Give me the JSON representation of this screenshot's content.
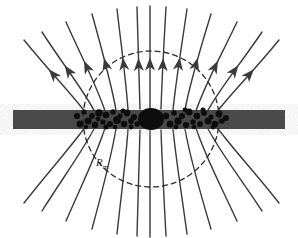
{
  "figure": {
    "type": "physics-diagram",
    "width": 298,
    "height": 238,
    "background": "#ffffff"
  },
  "colors": {
    "field_line": "#3a3a3a",
    "disk_bar": "#4a4a4a",
    "disk_bar_edge": "#5a5a5a",
    "central_object": "#111111",
    "clump": "#111111",
    "dashed_circle": "#2b2b2b",
    "label_text": "#2a2a2a"
  },
  "labels": [
    {
      "name": "magnetospheric-radius-label",
      "base": "R",
      "subscript": "m",
      "text": "Rm",
      "x": 96,
      "y": 156
    }
  ],
  "disk": {
    "name": "accretion-disk-bar",
    "x": 13,
    "y": 110,
    "width": 272,
    "height": 19,
    "fill": "#4a4a4a",
    "description": "horizontal dark-gray accretion disk seen edge-on"
  },
  "central_object": {
    "name": "central-star",
    "cx": 151,
    "cy": 119,
    "rx": 13,
    "ry": 11,
    "fill": "#111111",
    "description": "dark central magnetized star"
  },
  "dashed_circle": {
    "name": "magnetospheric-radius-circle",
    "cx": 151,
    "cy": 119,
    "r": 68,
    "stroke": "#2b2b2b",
    "dash": "5 4",
    "description": "dashed circle marking the magnetospheric radius Rm"
  },
  "clumps": {
    "name": "disk-material-clumps",
    "count": 46,
    "radius_range": [
      2.0,
      4.2
    ],
    "fill": "#111111",
    "description": "clumps of disk material crowded near the inner disk edge along the midplane",
    "points": [
      [
        77,
        116,
        3.1
      ],
      [
        80,
        124,
        3.4
      ],
      [
        84,
        112,
        2.6
      ],
      [
        88,
        121,
        3.6
      ],
      [
        92,
        116,
        2.9
      ],
      [
        95,
        125,
        3.2
      ],
      [
        99,
        113,
        3.8
      ],
      [
        103,
        122,
        2.7
      ],
      [
        106,
        115,
        3.3
      ],
      [
        110,
        124,
        3.0
      ],
      [
        113,
        112,
        2.8
      ],
      [
        117,
        120,
        3.9
      ],
      [
        120,
        116,
        2.6
      ],
      [
        124,
        124,
        3.2
      ],
      [
        127,
        113,
        3.4
      ],
      [
        131,
        121,
        2.9
      ],
      [
        134,
        117,
        3.1
      ],
      [
        137,
        124,
        2.7
      ],
      [
        98,
        119,
        2.4
      ],
      [
        106,
        127,
        2.5
      ],
      [
        115,
        127,
        2.3
      ],
      [
        123,
        111,
        2.5
      ],
      [
        131,
        127,
        2.4
      ],
      [
        86,
        127,
        2.3
      ],
      [
        166,
        116,
        3.2
      ],
      [
        170,
        124,
        3.5
      ],
      [
        174,
        113,
        2.8
      ],
      [
        178,
        121,
        3.7
      ],
      [
        182,
        116,
        3.0
      ],
      [
        186,
        125,
        3.1
      ],
      [
        189,
        112,
        3.6
      ],
      [
        193,
        122,
        2.7
      ],
      [
        197,
        116,
        3.3
      ],
      [
        200,
        124,
        2.9
      ],
      [
        204,
        113,
        3.0
      ],
      [
        208,
        121,
        3.5
      ],
      [
        211,
        117,
        2.6
      ],
      [
        215,
        124,
        3.2
      ],
      [
        219,
        114,
        3.4
      ],
      [
        222,
        121,
        2.8
      ],
      [
        226,
        118,
        3.0
      ],
      [
        176,
        127,
        2.4
      ],
      [
        185,
        110,
        2.4
      ],
      [
        194,
        127,
        2.3
      ],
      [
        203,
        110,
        2.5
      ],
      [
        213,
        127,
        2.4
      ]
    ]
  },
  "field_lines": {
    "name": "magnetic-field-lines",
    "count": 20,
    "stroke": "#3a3a3a",
    "stroke_width": 1.4,
    "description": "dipolar magnetic field lines threading the disk; arrowheads on the upper halves point outward away from the star",
    "arrowheads": {
      "present_on": "upper-half",
      "direction": "outward",
      "style": "slim-barbed",
      "count": 10
    },
    "upper": [
      {
        "d": "M 86,113 C 70,92 50,72 24,40",
        "arrow_t": 0.6
      },
      {
        "d": "M 95,112 C 82,88 64,66 42,32",
        "arrow_t": 0.58
      },
      {
        "d": "M 105,111 C 96,84 82,58 66,22",
        "arrow_t": 0.56
      },
      {
        "d": "M 116,110 C 111,82 102,50 92,14",
        "arrow_t": 0.54
      },
      {
        "d": "M 128,110 C 126,80 121,44 117,9",
        "arrow_t": 0.52
      },
      {
        "d": "M 140,109 C 139,78 138,42 137,7",
        "arrow_t": 0.5
      },
      {
        "d": "M 150,109 C 150,78 150,42 150,6",
        "arrow_t": 0.5
      },
      {
        "d": "M 161,109 C 162,78 164,42 166,7",
        "arrow_t": 0.5
      },
      {
        "d": "M 173,110 C 176,80 182,44 187,9",
        "arrow_t": 0.52
      },
      {
        "d": "M 185,110 C 190,82 200,50 211,14",
        "arrow_t": 0.54
      },
      {
        "d": "M 196,111 C 205,84 220,58 237,22",
        "arrow_t": 0.56
      },
      {
        "d": "M 207,112 C 220,88 239,66 262,32",
        "arrow_t": 0.58
      },
      {
        "d": "M 216,113 C 232,92 253,72 279,40",
        "arrow_t": 0.6
      }
    ],
    "lower": [
      {
        "d": "M 86,126 C 70,148 50,170 24,203"
      },
      {
        "d": "M 95,127 C 82,152 64,176 42,211"
      },
      {
        "d": "M 105,128 C 96,156 82,184 66,221"
      },
      {
        "d": "M 116,129 C 111,158 102,192 92,229"
      },
      {
        "d": "M 128,129 C 126,160 121,196 117,234"
      },
      {
        "d": "M 140,130 C 139,162 138,198 137,236"
      },
      {
        "d": "M 150,130 C 150,162 150,198 150,237"
      },
      {
        "d": "M 161,130 C 162,162 164,198 166,236"
      },
      {
        "d": "M 173,129 C 176,160 182,196 187,234"
      },
      {
        "d": "M 185,129 C 190,158 200,192 211,229"
      },
      {
        "d": "M 196,128 C 205,156 220,184 237,221"
      },
      {
        "d": "M 207,127 C 220,152 239,176 262,211"
      },
      {
        "d": "M 216,126 C 232,148 253,170 279,203"
      }
    ]
  }
}
